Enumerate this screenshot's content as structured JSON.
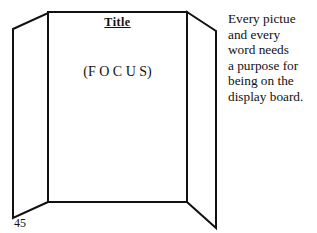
{
  "board": {
    "title": "Title",
    "focus": "(F O C U S)"
  },
  "side_note": {
    "lines": [
      "Every pictue",
      "and every",
      "word needs",
      "a purpose for",
      "being on the",
      "display board."
    ]
  },
  "page_number": "45"
}
